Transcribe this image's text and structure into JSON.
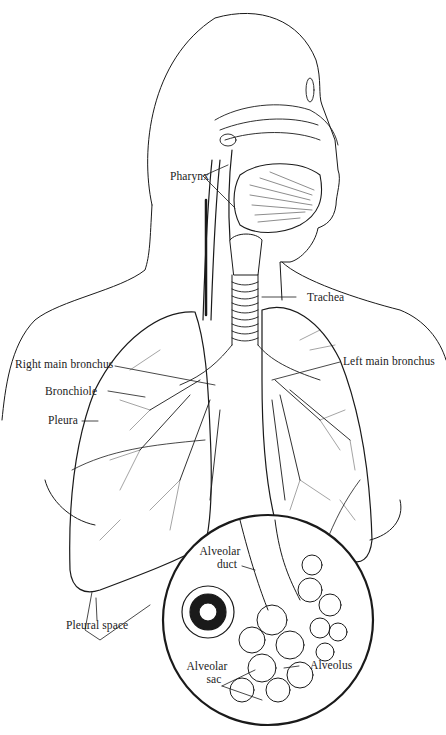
{
  "diagram": {
    "labels": {
      "pharynx": "Pharynx",
      "trachea": "Trachea",
      "right_main_bronchus": "Right main bronchus",
      "left_main_bronchus": "Left main bronchus",
      "bronchiole": "Bronchiole",
      "pleura": "Pleura",
      "pleural_space": "Pleural space",
      "alveolar_duct_line1": "Alveolar",
      "alveolar_duct_line2": "duct",
      "alveolar_sac_line1": "Alveolar",
      "alveolar_sac_line2": "sac",
      "alveolus": "Alveolus"
    },
    "colors": {
      "line": "#1a1a1a",
      "background": "#ffffff"
    }
  }
}
